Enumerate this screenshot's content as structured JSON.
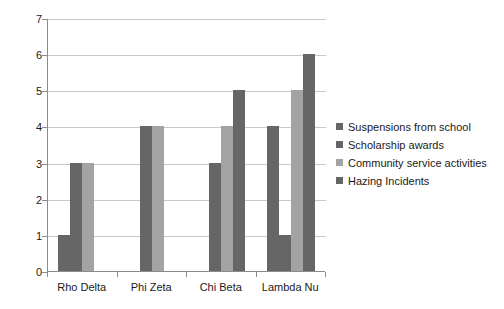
{
  "chart_data": {
    "type": "bar",
    "title": "",
    "xlabel": "",
    "ylabel": "",
    "ylim": [
      0,
      7
    ],
    "yticks": [
      "0",
      "1",
      "2",
      "3",
      "4",
      "5",
      "6",
      "7"
    ],
    "grid": true,
    "legend_position": "right",
    "categories": [
      "Rho Delta",
      "Phi Zeta",
      "Chi Beta",
      "Lambda Nu"
    ],
    "series": [
      {
        "name": "Suspensions from school",
        "color": "#666666",
        "values": [
          1,
          0,
          0,
          4
        ]
      },
      {
        "name": "Scholarship awards",
        "color": "#666666",
        "values": [
          3,
          4,
          3,
          1
        ]
      },
      {
        "name": "Community service activities",
        "color": "#a3a3a3",
        "values": [
          3,
          4,
          4,
          5
        ]
      },
      {
        "name": "Hazing Incidents",
        "color": "#666666",
        "values": [
          0,
          0,
          5,
          6
        ]
      }
    ]
  },
  "colors": {
    "dark_gray": "#666666",
    "light_gray": "#a3a3a3",
    "gridline": "#c8c8c8",
    "axis": "#8c8c8c",
    "text": "#1a1a1a",
    "background": "#ffffff"
  }
}
